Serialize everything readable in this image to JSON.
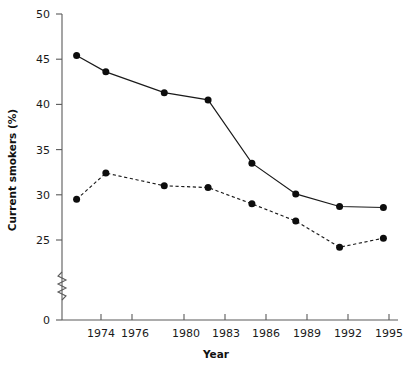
{
  "chart_data": {
    "type": "line",
    "title": "",
    "xlabel": "Year",
    "ylabel": "Current smokers (%)",
    "x": [
      1974,
      1976,
      1980,
      1983,
      1986,
      1989,
      1992,
      1995
    ],
    "categories": [
      "1974",
      "1976",
      "1980",
      "1983",
      "1986",
      "1989",
      "1992",
      "1995"
    ],
    "xlim": [
      1973,
      1996
    ],
    "ylim": [
      24,
      50
    ],
    "yticks": [
      25,
      30,
      35,
      40,
      45,
      50
    ],
    "ytick_labels": [
      "25",
      "30",
      "35",
      "40",
      "45",
      "50"
    ],
    "y_origin_label": "0",
    "y_axis_break": true,
    "grid": false,
    "legend": "none",
    "series": [
      {
        "name": "solid-series",
        "style": "solid",
        "marker": "filled-circle",
        "color": "#1a1a1a",
        "values": [
          45.4,
          43.6,
          41.3,
          40.5,
          33.5,
          30.1,
          28.7,
          28.6
        ]
      },
      {
        "name": "dashed-series",
        "style": "dashed",
        "marker": "filled-circle",
        "color": "#1a1a1a",
        "values": [
          29.5,
          32.4,
          31.0,
          30.8,
          29.0,
          27.1,
          24.2,
          25.2
        ]
      }
    ]
  },
  "axes": {
    "y_label": "Current smokers (%)",
    "x_label": "Year"
  }
}
